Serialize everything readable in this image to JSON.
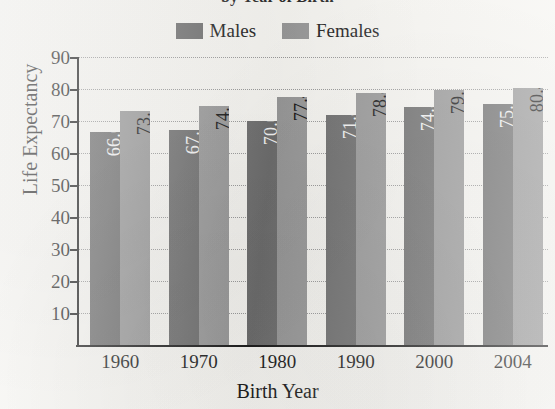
{
  "chart_data": {
    "type": "bar",
    "title": "by Year of Birth",
    "title_note": "title clipped at top edge of image",
    "xlabel": "Birth Year",
    "ylabel": "Life Expectancy",
    "categories": [
      "1960",
      "1970",
      "1980",
      "1990",
      "2000",
      "2004"
    ],
    "series": [
      {
        "name": "Males",
        "color": "#6e6e6e",
        "values": [
          66.6,
          67.1,
          70.0,
          71.8,
          74.3,
          75.2
        ]
      },
      {
        "name": "Females",
        "color": "#989898",
        "values": [
          73.1,
          74.7,
          77.4,
          78.8,
          79.7,
          80.4
        ]
      }
    ],
    "ylim": [
      0,
      90
    ],
    "yticks": [
      90,
      80,
      70,
      60,
      50,
      40,
      30,
      20,
      10
    ],
    "grid": true,
    "legend_position": "top-center",
    "value_labels": true
  },
  "legend": {
    "items": [
      {
        "label": "Males",
        "color": "#6e6e6e"
      },
      {
        "label": "Females",
        "color": "#989898"
      }
    ]
  },
  "colors": {
    "male_bar": "#6e6e6e",
    "female_bar": "#989898",
    "axis": "#1d1d1d",
    "gridline": "#9a9a9a",
    "paper": "#f6f5f1"
  }
}
